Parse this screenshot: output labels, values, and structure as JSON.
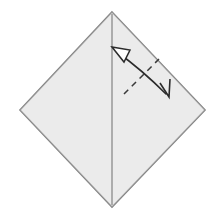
{
  "figure": {
    "kind": "origami-fold-diagram",
    "title": "Origami square with vertical center crease and fold-and-unfold arrow",
    "canvas": {
      "width": 219,
      "height": 214,
      "background_color": "#ffffff"
    },
    "paper": {
      "name": "square-sheet-diamond-orientation",
      "shape": "square rotated 45 degrees (diamond)",
      "fill_color": "#e9e9e9",
      "stroke_color": "#808080",
      "stroke_width": 1.6,
      "points": "112,12 205,110 112,207 20,110",
      "vertices": {
        "top": [
          112,
          12
        ],
        "right": [
          205,
          110
        ],
        "bottom": [
          112,
          207
        ],
        "left": [
          20,
          110
        ]
      }
    },
    "crease": {
      "name": "vertical-center-crease",
      "type": "existing-crease-line",
      "stroke_color": "#8a8a8a",
      "stroke_width": 1.3,
      "x1": 112,
      "y1": 14,
      "x2": 112,
      "y2": 205
    },
    "fold_line": {
      "name": "dashed-fold-line",
      "type": "valley-fold-dashed",
      "stroke_color": "#3a3a3a",
      "stroke_width": 1.5,
      "dash_pattern": "6 5",
      "x1": 124,
      "y1": 94,
      "x2": 159,
      "y2": 59
    },
    "arrow": {
      "name": "fold-and-unfold-arrow",
      "type": "double-headed-curved-arrow",
      "stroke_color": "#2b2b2b",
      "stroke_width": 1.6,
      "path": "M 117,52 C 131,62 150,78 166,94",
      "head_unfold": {
        "name": "hollow-arrowhead-unfold",
        "style": "open hollow triangle",
        "fill_color": "#ffffff",
        "stroke_color": "#2b2b2b",
        "points": "112,47 130,50 124,62",
        "direction": "up-left"
      },
      "head_fold": {
        "name": "solid-arrowhead-fold",
        "style": "thin open V",
        "stroke_color": "#2b2b2b",
        "points": "160,83 169,97 170,79",
        "direction": "down-right"
      }
    }
  },
  "chart_data": {
    "type": "diagram",
    "elements": [
      {
        "label": "square sheet (diamond)",
        "geometry": "polygon",
        "points": [
          [
            112,
            12
          ],
          [
            205,
            110
          ],
          [
            112,
            207
          ],
          [
            20,
            110
          ]
        ]
      },
      {
        "label": "vertical center crease",
        "geometry": "line",
        "points": [
          [
            112,
            14
          ],
          [
            112,
            205
          ]
        ]
      },
      {
        "label": "dashed fold line",
        "geometry": "dashed-line",
        "points": [
          [
            124,
            94
          ],
          [
            159,
            59
          ]
        ]
      },
      {
        "label": "fold-and-unfold curved arrow",
        "geometry": "curve",
        "points": [
          [
            117,
            52
          ],
          [
            166,
            94
          ]
        ]
      }
    ]
  }
}
